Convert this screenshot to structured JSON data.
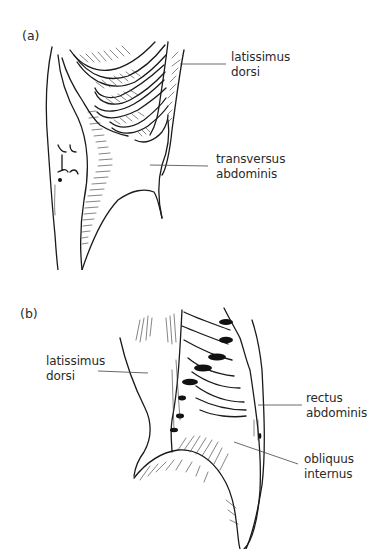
{
  "figure": {
    "panels": [
      {
        "id": "a",
        "label": "(a)",
        "labels": [
          {
            "name": "latissimus-dorsi",
            "text": "latissimus\ndorsi"
          },
          {
            "name": "transversus-abdominis",
            "text": "transversus\nabdominis"
          }
        ]
      },
      {
        "id": "b",
        "label": "(b)",
        "labels": [
          {
            "name": "latissimus-dorsi",
            "text": "latissimus\ndorsi"
          },
          {
            "name": "rectus-abdominis",
            "text": "rectus\nabdominis"
          },
          {
            "name": "obliquus-internus",
            "text": "obliquus\ninternus"
          }
        ]
      }
    ],
    "colors": {
      "background": "#ffffff",
      "ink": "#1a1a1a",
      "text": "#2a2a2a"
    }
  }
}
